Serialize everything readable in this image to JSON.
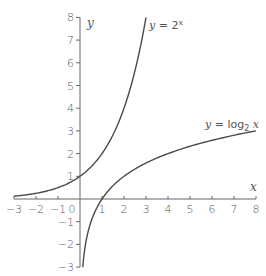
{
  "chart_data": {
    "type": "line",
    "title": "",
    "xlabel": "x",
    "ylabel": "y",
    "xlim": [
      -3,
      8
    ],
    "ylim": [
      -3,
      8
    ],
    "grid": false,
    "legend": "none (inline curve labels)",
    "x_ticks": [
      -3,
      -2,
      -1,
      0,
      1,
      2,
      3,
      4,
      5,
      6,
      7,
      8
    ],
    "y_ticks": [
      -3,
      -2,
      -1,
      1,
      2,
      3,
      4,
      5,
      6,
      7,
      8
    ],
    "series": [
      {
        "name": "y = 2^x",
        "label": "y = 2^x",
        "function": "2^x",
        "x": [
          -3,
          -2,
          -1,
          0,
          1,
          2,
          3
        ],
        "values": [
          0.125,
          0.25,
          0.5,
          1,
          2,
          4,
          8
        ]
      },
      {
        "name": "y = log2 x",
        "label": "y = log₂ x",
        "function": "log2(x)",
        "x": [
          0.125,
          0.25,
          0.5,
          1,
          2,
          4,
          8
        ],
        "values": [
          -3,
          -2,
          -1,
          0,
          1,
          2,
          3
        ]
      }
    ],
    "annotations": [
      {
        "text": "y = 2^x",
        "near": [
          3,
          8
        ]
      },
      {
        "text": "y = log₂ x",
        "near": [
          6,
          3.2
        ]
      }
    ]
  },
  "labels": {
    "x_axis": "x",
    "y_axis": "y",
    "origin": "0",
    "exp_curve_y": "y",
    "exp_curve_eq": " = 2",
    "exp_curve_sup": "x",
    "log_curve_y": "y",
    "log_curve_eq": " = log",
    "log_curve_sub": "2",
    "log_curve_x": " x"
  }
}
